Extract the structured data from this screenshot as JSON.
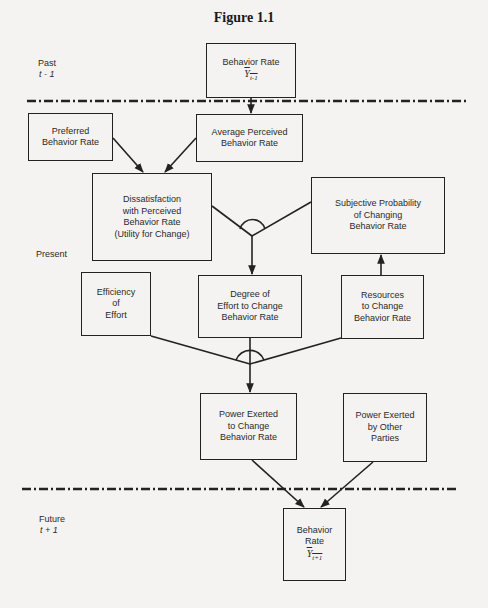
{
  "figure": {
    "title": "Figure 1.1"
  },
  "time_labels": {
    "past": {
      "label": "Past",
      "sub": "t - 1"
    },
    "present": {
      "label": "Present"
    },
    "future": {
      "label": "Future",
      "sub": "t + 1"
    }
  },
  "nodes": {
    "behavior_rate_past": {
      "lines": [
        "Behavior Rate"
      ],
      "symbol": "Y",
      "subscript": "t-1"
    },
    "preferred_behavior_rate": {
      "lines": [
        "Preferred",
        "Behavior Rate"
      ]
    },
    "average_perceived_behavior_rate": {
      "lines": [
        "Average Perceived",
        "Behavior Rate"
      ]
    },
    "dissatisfaction": {
      "lines": [
        "Dissatisfaction",
        "with Perceived",
        "Behavior Rate",
        "(Utility for Change)"
      ]
    },
    "subjective_probability": {
      "lines": [
        "Subjective Probability",
        "of Changing",
        "Behavior Rate"
      ]
    },
    "efficiency_of_effort": {
      "lines": [
        "Efficiency",
        "of",
        "Effort"
      ]
    },
    "degree_of_effort": {
      "lines": [
        "Degree of",
        "Effort to Change",
        "Behavior Rate"
      ]
    },
    "resources_to_change": {
      "lines": [
        "Resources",
        "to Change",
        "Behavior Rate"
      ]
    },
    "power_exerted_to_change": {
      "lines": [
        "Power Exerted",
        "to Change",
        "Behavior Rate"
      ]
    },
    "power_exerted_by_others": {
      "lines": [
        "Power Exerted",
        "by Other",
        "Parties"
      ]
    },
    "behavior_rate_future": {
      "lines": [
        "Behavior",
        "Rate"
      ],
      "symbol": "Y",
      "subscript": "t+1"
    }
  },
  "edges": [
    {
      "from": "behavior_rate_past",
      "to": "average_perceived_behavior_rate"
    },
    {
      "from": "preferred_behavior_rate",
      "to": "dissatisfaction"
    },
    {
      "from": "average_perceived_behavior_rate",
      "to": "dissatisfaction"
    },
    {
      "from": [
        "dissatisfaction",
        "subjective_probability"
      ],
      "to": "degree_of_effort",
      "type": "interaction"
    },
    {
      "from": "resources_to_change",
      "to": "subjective_probability"
    },
    {
      "from": [
        "efficiency_of_effort",
        "degree_of_effort",
        "resources_to_change"
      ],
      "to": "power_exerted_to_change",
      "type": "interaction"
    },
    {
      "from": "power_exerted_to_change",
      "to": "behavior_rate_future"
    },
    {
      "from": "power_exerted_by_others",
      "to": "behavior_rate_future"
    }
  ],
  "colors": {
    "background": "#f4f3f1",
    "ink": "#222222"
  }
}
